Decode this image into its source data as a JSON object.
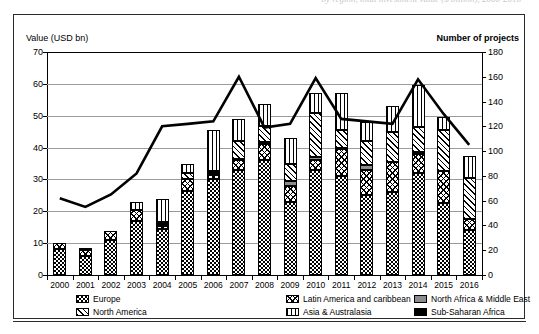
{
  "top_caption": "by region, total investment value ($ billion), 2000-2016",
  "axis": {
    "left_title": "Value (USD bn)",
    "right_title": "Number of projects",
    "left_ticks": [
      0,
      10,
      20,
      30,
      40,
      50,
      60,
      70
    ],
    "right_ticks": [
      0,
      20,
      40,
      60,
      80,
      100,
      120,
      140,
      160,
      180
    ]
  },
  "legend": {
    "columns": [
      [
        {
          "label": "Europe",
          "pattern": "p-europe",
          "key": "europe"
        },
        {
          "label": "North America",
          "pattern": "p-northamerica",
          "key": "north_america"
        }
      ],
      [
        {
          "label": "Latin America and caribbean",
          "pattern": "p-latam",
          "key": "latin_america"
        },
        {
          "label": "Asia & Australasia",
          "pattern": "p-asia",
          "key": "asia"
        }
      ],
      [
        {
          "label": "North Africa & Middle East",
          "pattern": "p-nafrme",
          "key": "north_africa_me"
        },
        {
          "label": "Sub-Saharan Africa",
          "pattern": "p-ssa",
          "key": "sub_saharan"
        }
      ]
    ]
  },
  "chart_data": {
    "type": "bar",
    "title": "",
    "xlabel": "",
    "ylabel": "Value (USD bn)",
    "y2label": "Number of projects",
    "ylim": [
      0,
      70
    ],
    "y2lim": [
      0,
      180
    ],
    "grid": true,
    "legend_position": "bottom",
    "categories": [
      "2000",
      "2001",
      "2002",
      "2003",
      "2004",
      "2005",
      "2006",
      "2007",
      "2008",
      "2009",
      "2010",
      "2011",
      "2012",
      "2013",
      "2014",
      "2015",
      "2016"
    ],
    "stacked": true,
    "stack_order": [
      "europe",
      "latin_america",
      "north_africa_me",
      "sub_saharan",
      "north_america",
      "asia"
    ],
    "series": [
      {
        "name": "Europe",
        "key": "europe",
        "pattern": "p-europe",
        "values": [
          8.2,
          6.0,
          11.0,
          17.0,
          14.5,
          26.5,
          30.0,
          33.0,
          36.0,
          23.0,
          33.0,
          31.0,
          25.0,
          26.0,
          32.0,
          22.5,
          14.0
        ]
      },
      {
        "name": "Latin America and caribbean",
        "key": "latin_america",
        "pattern": "p-latam",
        "values": [
          2.0,
          1.8,
          2.8,
          3.5,
          1.0,
          3.5,
          1.5,
          3.0,
          5.0,
          5.0,
          3.0,
          8.5,
          8.0,
          9.5,
          6.0,
          10.0,
          3.5
        ]
      },
      {
        "name": "North Africa & Middle East",
        "key": "north_africa_me",
        "pattern": "p-nafrme",
        "values": [
          0.0,
          0.0,
          0.0,
          0.0,
          0.5,
          0.0,
          0.5,
          0.5,
          0.8,
          1.5,
          1.0,
          0.5,
          1.5,
          0.0,
          0.5,
          0.0,
          0.0
        ]
      },
      {
        "name": "Sub-Saharan Africa",
        "key": "sub_saharan",
        "pattern": "p-ssa",
        "values": [
          0.0,
          0.5,
          0.0,
          0.0,
          0.5,
          0.0,
          0.0,
          0.0,
          0.0,
          0.0,
          0.0,
          0.0,
          0.0,
          0.0,
          0.0,
          0.0,
          0.0
        ]
      },
      {
        "name": "North America",
        "key": "north_america",
        "pattern": "p-northamerica",
        "values": [
          0.0,
          0.0,
          0.0,
          0.0,
          0.0,
          2.0,
          0.5,
          5.5,
          5.0,
          5.5,
          14.0,
          5.5,
          7.5,
          9.5,
          8.0,
          13.0,
          13.0
        ]
      },
      {
        "name": "Asia & Australasia",
        "key": "asia",
        "pattern": "p-asia",
        "values": [
          0.0,
          0.0,
          0.0,
          2.5,
          7.5,
          3.0,
          13.0,
          7.0,
          7.0,
          8.0,
          6.0,
          11.5,
          6.0,
          8.0,
          13.0,
          4.0,
          7.0
        ]
      }
    ],
    "line_series": {
      "name": "Number of projects",
      "axis": "right",
      "color": "#000000",
      "values": [
        62,
        55,
        65,
        82,
        120,
        122,
        124,
        160,
        119,
        122,
        159,
        126,
        124,
        122,
        158,
        130,
        105
      ]
    }
  }
}
